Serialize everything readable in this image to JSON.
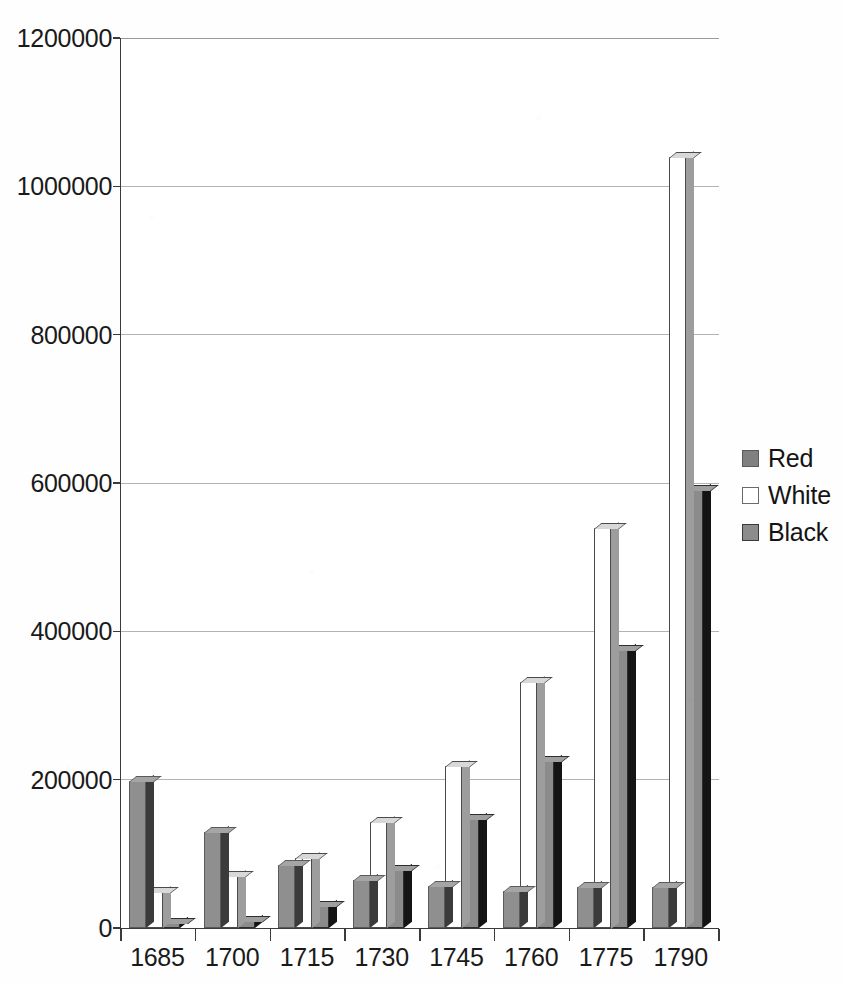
{
  "chart_data": {
    "type": "bar",
    "title": "",
    "subtitle": "",
    "xlabel": "",
    "ylabel": "",
    "categories": [
      "1685",
      "1700",
      "1715",
      "1730",
      "1745",
      "1760",
      "1775",
      "1790"
    ],
    "series": [
      {
        "name": "Red",
        "color": "#808080",
        "values": [
          198000,
          130000,
          85000,
          65000,
          57000,
          50000,
          55000,
          55000
        ]
      },
      {
        "name": "White",
        "color": "#ffffff",
        "values": [
          48000,
          70000,
          95000,
          143000,
          218000,
          332000,
          540000,
          1040000
        ]
      },
      {
        "name": "Black",
        "color": "#8c8c8c",
        "values": [
          7000,
          10000,
          30000,
          78000,
          147000,
          225000,
          375000,
          590000
        ]
      }
    ],
    "ylim": [
      0,
      1200000
    ],
    "ytick_values": [
      0,
      200000,
      400000,
      600000,
      800000,
      1000000,
      1200000
    ],
    "ytick_labels": [
      "0",
      "200000",
      "400000",
      "600000",
      "800000",
      "1000000",
      "1200000"
    ],
    "grid": true,
    "grid_axis": "y",
    "legend": {
      "position": "right",
      "entries": [
        {
          "label": "Red",
          "swatch": "swatch-red"
        },
        {
          "label": "White",
          "swatch": "swatch-white"
        },
        {
          "label": "Black",
          "swatch": "swatch-black"
        }
      ]
    },
    "style": "3d-column",
    "axis_color": "#3a3a3a",
    "gridline_color": "#b3b3b3",
    "background_color": "#ffffff"
  }
}
